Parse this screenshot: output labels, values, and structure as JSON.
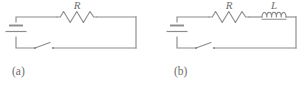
{
  "figure": {
    "name": "rl-circuit-pair",
    "stroke_color": "#8c8c8c",
    "label_color": "#6f6f6f",
    "background": "#ffffff",
    "panels": [
      {
        "id": "a",
        "caption": "(a)",
        "components": [
          {
            "type": "battery",
            "label": ""
          },
          {
            "type": "switch",
            "label": "",
            "state": "open"
          },
          {
            "type": "resistor",
            "label": "R",
            "zigzags": 6
          }
        ]
      },
      {
        "id": "b",
        "caption": "(b)",
        "components": [
          {
            "type": "battery",
            "label": ""
          },
          {
            "type": "switch",
            "label": "",
            "state": "open"
          },
          {
            "type": "resistor",
            "label": "R",
            "zigzags": 6
          },
          {
            "type": "inductor",
            "label": "L",
            "coils": 5
          }
        ]
      }
    ]
  }
}
